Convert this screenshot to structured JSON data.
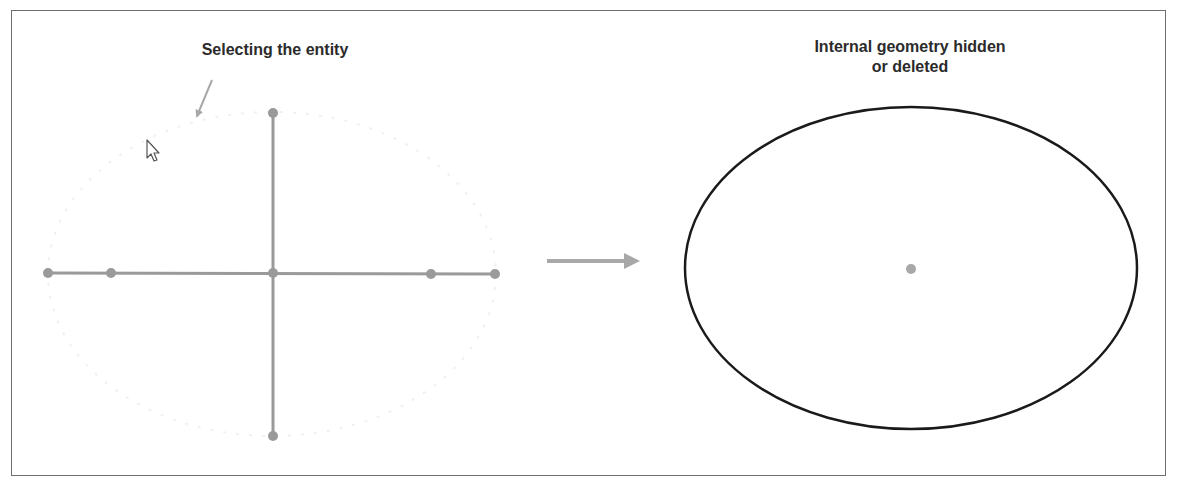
{
  "diagram": {
    "before": {
      "caption": "Selecting the entity",
      "annotation_arrow": {
        "from": [
          212,
          80
        ],
        "to": [
          196,
          118
        ],
        "color": "#a8a8a8"
      },
      "cursor": {
        "tip": [
          147,
          140
        ],
        "icon": "mouse-pointer-icon"
      },
      "ghost_ellipse": {
        "cx": 272,
        "cy": 274,
        "rx": 224,
        "ry": 162,
        "color": "#f2f2f2"
      },
      "construction_color": "#9a9a9a",
      "horizontal_axis": {
        "from": [
          48,
          273
        ],
        "to": [
          495,
          274
        ]
      },
      "vertical_axis": {
        "from": [
          273,
          113
        ],
        "to": [
          273,
          436
        ]
      },
      "points": [
        {
          "name": "left-vertex",
          "x": 48,
          "y": 273
        },
        {
          "name": "left-focus",
          "x": 111,
          "y": 273
        },
        {
          "name": "center",
          "x": 273,
          "y": 273
        },
        {
          "name": "right-focus",
          "x": 431,
          "y": 274
        },
        {
          "name": "right-vertex",
          "x": 495,
          "y": 274
        },
        {
          "name": "top-co-vertex",
          "x": 273,
          "y": 113
        },
        {
          "name": "bottom-co-vertex",
          "x": 273,
          "y": 436
        }
      ]
    },
    "transition_arrow": {
      "from": [
        547,
        261
      ],
      "to": [
        651,
        261
      ],
      "color": "#a8a8a8"
    },
    "after": {
      "caption": "Internal geometry hidden\nor deleted",
      "ellipse": {
        "cx": 911,
        "cy": 268,
        "rx": 226,
        "ry": 161,
        "color": "#1a1a1a"
      },
      "center_point": {
        "x": 911,
        "y": 269,
        "color": "#a8a8a8"
      }
    }
  }
}
